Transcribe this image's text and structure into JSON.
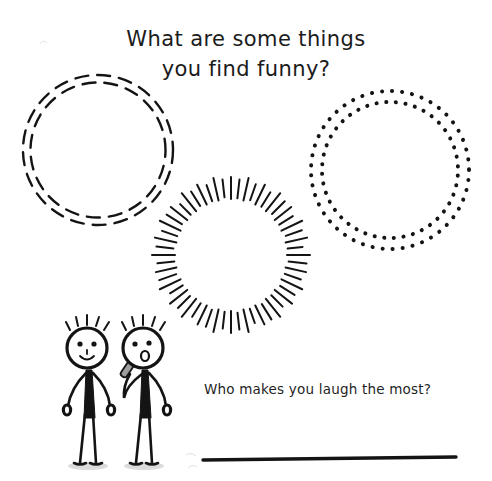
{
  "page": {
    "background_color": "#ffffff",
    "ink_color": "#141414",
    "width": 492,
    "height": 481
  },
  "heading": {
    "line1": "What are some things",
    "line2": "you find funny?"
  },
  "prompt": {
    "question": "Who makes you laugh the most?"
  },
  "answer_line": {
    "label": "",
    "value": ""
  },
  "frames": [
    {
      "name": "dashed-double-circle",
      "style": "dashed",
      "rings": 2,
      "center_x": 98,
      "center_y": 150,
      "radius_outer": 75,
      "radius_inner": 68
    },
    {
      "name": "sunburst-circle",
      "style": "radial-burst",
      "rays": 56,
      "center_x": 231,
      "center_y": 255,
      "radius_outer": 78,
      "radius_inner": 56
    },
    {
      "name": "dotted-double-circle",
      "style": "dotted",
      "rings": 2,
      "center_x": 390,
      "center_y": 170,
      "radius_outer": 79,
      "radius_inner": 68
    }
  ],
  "figures": [
    {
      "name": "stick-figure-smiling",
      "expression": "smile",
      "holds": "none",
      "head_x": 87,
      "head_y": 348
    },
    {
      "name": "stick-figure-with-microphone",
      "expression": "open-mouth",
      "holds": "microphone",
      "head_x": 143,
      "head_y": 348
    }
  ],
  "colors": {
    "ink": "#141414",
    "paper": "#ffffff",
    "shadow": "#cfcfcf",
    "faint": "#e8e8e8"
  }
}
